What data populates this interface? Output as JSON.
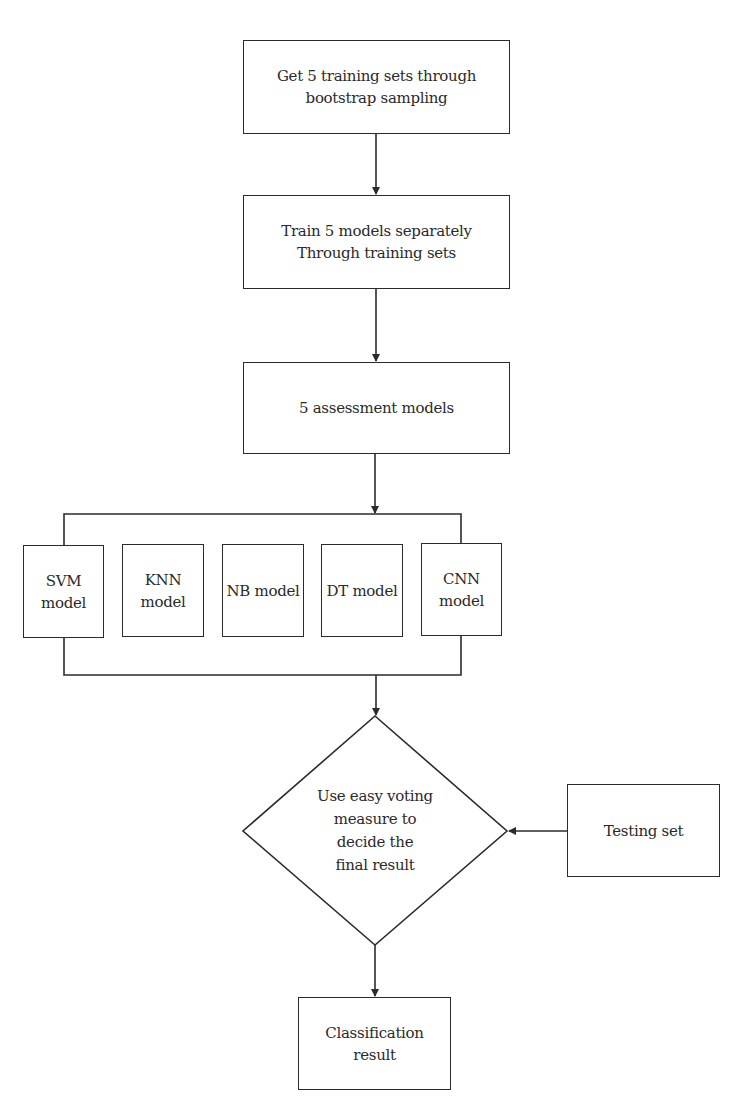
{
  "flowchart": {
    "nodes": {
      "bootstrap": {
        "lines": [
          "Get 5 training sets through",
          "bootstrap sampling"
        ]
      },
      "train": {
        "lines": [
          "Train 5 models separately",
          "Through training sets"
        ]
      },
      "assessment": {
        "lines": [
          "5 assessment models"
        ]
      },
      "models": [
        {
          "label": "SVM model"
        },
        {
          "label": "KNN model"
        },
        {
          "label": "NB model"
        },
        {
          "label": "DT model"
        },
        {
          "label": "CNN model"
        }
      ],
      "voting": {
        "lines": [
          "Use easy voting",
          "measure to",
          "decide the",
          "final result"
        ]
      },
      "testing": {
        "lines": [
          "Testing set"
        ]
      },
      "result": {
        "lines": [
          "Classification",
          "result"
        ]
      }
    },
    "colors": {
      "stroke": "#2b2b2b",
      "text": "#2a2a2a",
      "background": "#ffffff"
    }
  }
}
